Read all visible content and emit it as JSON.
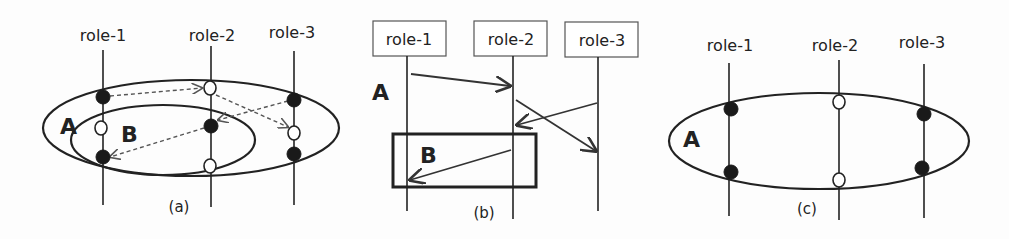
{
  "panel_a": {
    "roles": [
      "role-1",
      "role-2",
      "role-3"
    ],
    "region_outer": "A",
    "region_inner": "B",
    "caption": "(a)"
  },
  "panel_b": {
    "roles": [
      "role-1",
      "role-2",
      "role-3"
    ],
    "region_outer": "A",
    "region_inner": "B",
    "caption": "(b)"
  },
  "panel_c": {
    "roles": [
      "role-1",
      "role-2",
      "role-3"
    ],
    "region_outer": "A",
    "caption": "(c)"
  }
}
